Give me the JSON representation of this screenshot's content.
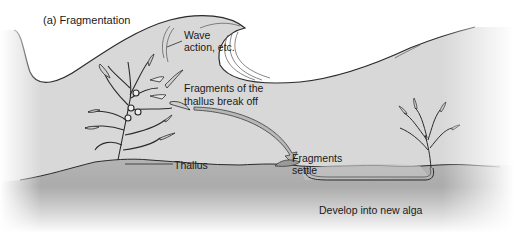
{
  "figure": {
    "title": "(a) Fragmentation",
    "colors": {
      "water": "#d8d8d8",
      "sky": "#ffffff",
      "ground": "#a8a8a8",
      "ground_top": "#bdbdbd",
      "outline": "#2a2a2a",
      "arrow": "#b8b8b8"
    }
  },
  "labels": {
    "wave": [
      "Wave",
      "action, etc."
    ],
    "fragments_break": [
      "Fragments of the",
      "thallus break off"
    ],
    "thallus": "Thallus",
    "fragments_settle": [
      "Fragments",
      "settle"
    ],
    "develop": "Develop into new alga"
  }
}
